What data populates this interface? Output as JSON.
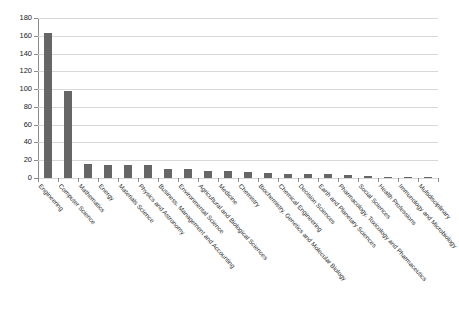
{
  "chart_data": {
    "type": "bar",
    "title": "",
    "subtitle": "",
    "xlabel": "",
    "ylabel": "",
    "ylim": [
      0,
      180
    ],
    "ytick_step": 20,
    "yticks": [
      0,
      20,
      40,
      60,
      80,
      100,
      120,
      140,
      160,
      180
    ],
    "grid": "horizontal",
    "legend": "none",
    "bar_color": "#666666",
    "gridline_color": "#d8d8d8",
    "axis_color": "#8a8a8a",
    "categories": [
      "Engineering",
      "Computer Science",
      "Mathematics",
      "Energy",
      "Materials Science",
      "Physics and Astronomy",
      "Business, Management and Accounting",
      "Environmental Science",
      "Agricultural and Biological Sciences",
      "Medicine",
      "Chemistry",
      "Biochemistry, Genetics and Molecular Biology",
      "Chemical Engineering",
      "Decision Sciences",
      "Earth and Planetary Sciences",
      "Pharmacology, Toxicology and Pharmaceutics",
      "Social Sciences",
      "Health Professions",
      "Immunology and Microbiology",
      "Multidisciplinary"
    ],
    "values": [
      163,
      98,
      16,
      15,
      15,
      15,
      10,
      10,
      8,
      8,
      7,
      6,
      5,
      5,
      5,
      3,
      2,
      1,
      1,
      1
    ]
  }
}
